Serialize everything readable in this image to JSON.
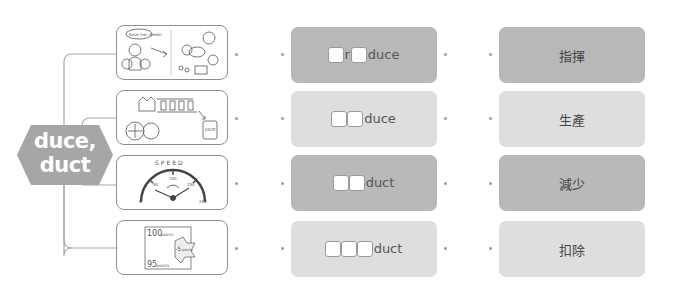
{
  "root": {
    "label_line1": "duce,",
    "label_line2": "duct",
    "color": "#a6a6a6"
  },
  "rows": [
    {
      "image": {
        "icon": "seed-kids-illustration-icon",
        "caption": "Save me, seeds!"
      },
      "word": {
        "parts": [
          "",
          "r",
          "",
          "duce"
        ],
        "display": "□r□duce"
      },
      "meaning": "指揮",
      "style": "dark"
    },
    {
      "image": {
        "icon": "juice-factory-illustration-icon",
        "caption": "JUICE"
      },
      "word": {
        "parts": [
          "",
          "",
          "duce"
        ],
        "display": "□□duce"
      },
      "meaning": "生產",
      "style": "light"
    },
    {
      "image": {
        "icon": "speedometer-illustration-icon",
        "caption": "SPEED",
        "ticks": [
          "0",
          "50",
          "100",
          "150",
          "200"
        ]
      },
      "word": {
        "parts": [
          "",
          "",
          "duct"
        ],
        "display": "□□duct"
      },
      "meaning": "減少",
      "style": "dark"
    },
    {
      "image": {
        "icon": "points-deduction-illustration-icon",
        "lines": [
          "100 points",
          "-5 points",
          "95 points"
        ]
      },
      "word": {
        "parts": [
          "",
          "",
          "",
          "duct"
        ],
        "display": "□□□duct"
      },
      "meaning": "扣除",
      "style": "light"
    }
  ],
  "colors": {
    "dark_card": "#b9b9b9",
    "light_card": "#dedede",
    "line": "#9a9a9a",
    "dot": "#9a9a9a"
  }
}
